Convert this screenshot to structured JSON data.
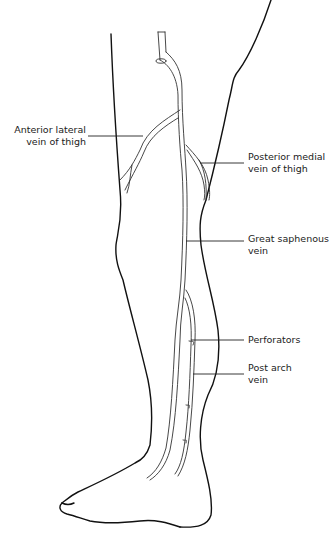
{
  "diagram": {
    "labels": [
      {
        "id": "anterior-lateral",
        "line1": "Anterior lateral",
        "line2": "vein of thigh"
      },
      {
        "id": "posterior-medial",
        "line1": "Posterior medial",
        "line2": "vein of thigh"
      },
      {
        "id": "great-saphenous",
        "line1": "Great saphenous",
        "line2": "vein"
      },
      {
        "id": "perforators",
        "line1": "Perforators"
      },
      {
        "id": "post-arch",
        "line1": "Post arch",
        "line2": "vein"
      }
    ],
    "colors": {
      "outline": "#111111",
      "text": "#222222",
      "background": "#ffffff"
    }
  }
}
